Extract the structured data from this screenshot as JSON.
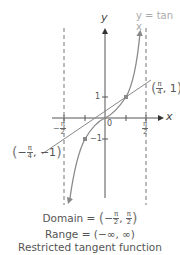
{
  "diagram": {
    "title": "Restricted tangent function",
    "function_label": "y = tan x",
    "axes": {
      "x_label": "x",
      "y_label": "y",
      "origin_label": "0"
    },
    "ticks": {
      "x_left": {
        "num": "π",
        "den": "2",
        "sign": "−"
      },
      "x_right": {
        "num": "π",
        "den": "2",
        "sign": ""
      },
      "y_pos": "1",
      "y_neg": "−1"
    },
    "points": [
      {
        "label_num": "π",
        "label_den": "4",
        "sign": "",
        "y": "1"
      },
      {
        "label_num": "π",
        "label_den": "4",
        "sign": "−",
        "y": "−1"
      }
    ],
    "domain": {
      "prefix": "Domain = ",
      "left_sign": "−",
      "num": "π",
      "den": "2"
    },
    "range": "Range = (−∞, ∞)",
    "colors": {
      "axis": "#555555",
      "curve": "#8a8a8a",
      "asymptote": "#777777",
      "text": "#555555",
      "point": "#888888"
    }
  }
}
